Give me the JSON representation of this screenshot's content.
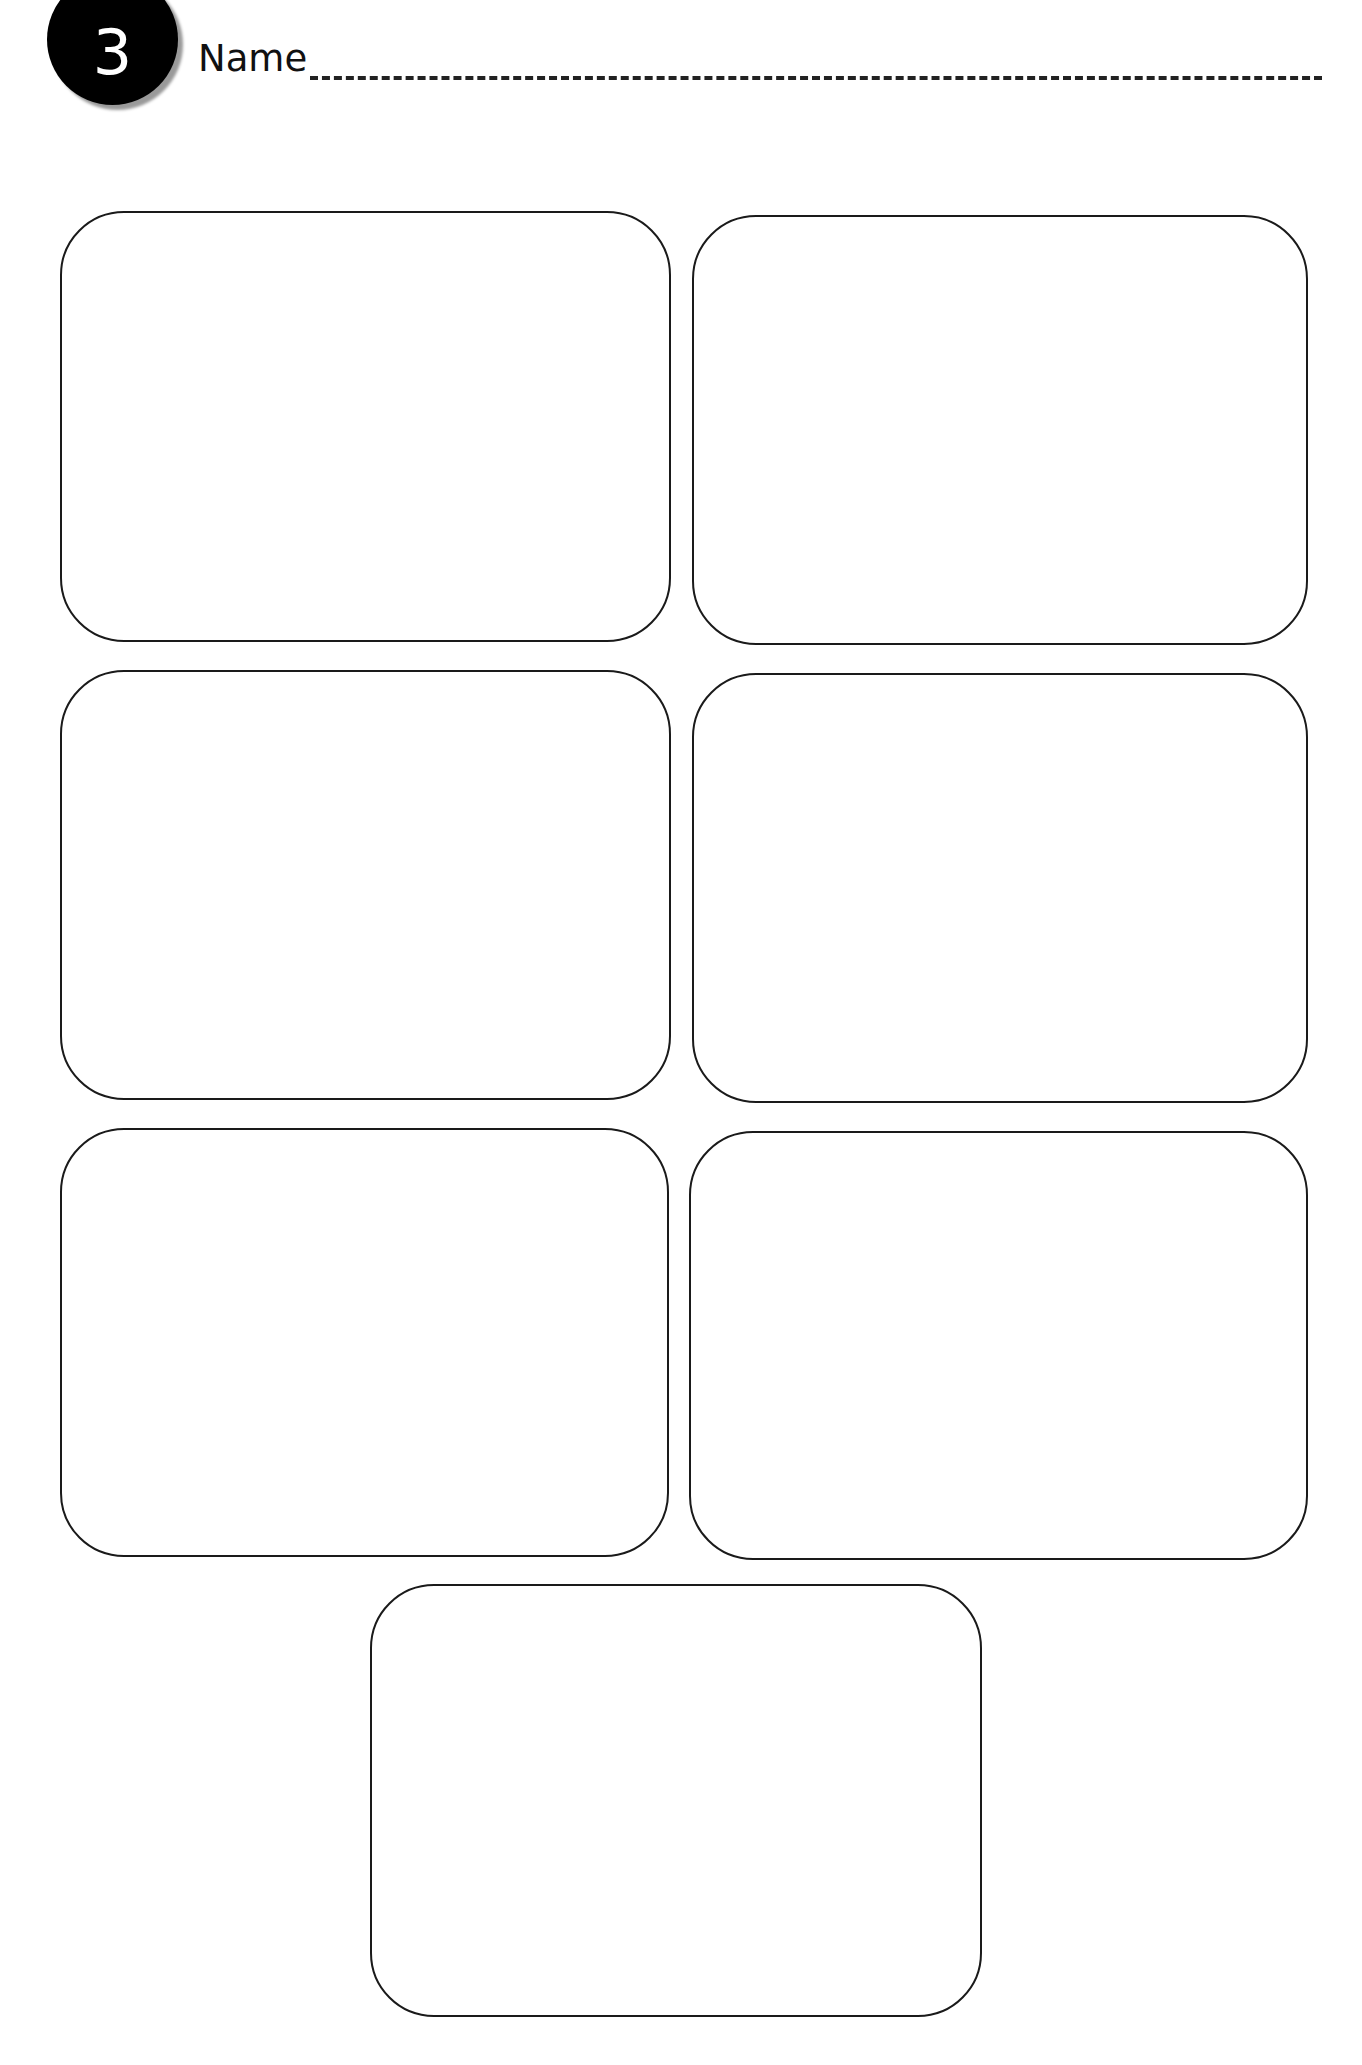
{
  "header": {
    "badge_number": "3",
    "name_label": "Name",
    "name_value": ""
  },
  "colors": {
    "ink": "#1a1a1a",
    "badge_bg": "#000000",
    "badge_text": "#ffffff",
    "background": "#ffffff"
  },
  "cards": [
    {
      "id": 1,
      "content": ""
    },
    {
      "id": 2,
      "content": ""
    },
    {
      "id": 3,
      "content": ""
    },
    {
      "id": 4,
      "content": ""
    },
    {
      "id": 5,
      "content": ""
    },
    {
      "id": 6,
      "content": ""
    },
    {
      "id": 7,
      "content": ""
    }
  ]
}
